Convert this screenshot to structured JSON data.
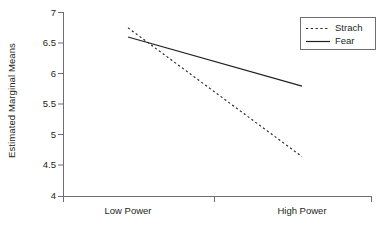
{
  "chart_data": {
    "type": "line",
    "title": "",
    "xlabel": "",
    "ylabel": "Estimated Marginal Means",
    "categories": [
      "Low Power",
      "High Power"
    ],
    "xtick_labels": [
      "Low Power",
      "High Power"
    ],
    "ytick_labels": [
      "4",
      "4.5",
      "5",
      "5.5",
      "6",
      "6.5",
      "7"
    ],
    "ytick_values": [
      4,
      4.5,
      5,
      5.5,
      6,
      6.5,
      7
    ],
    "ylim": [
      4,
      7
    ],
    "grid": false,
    "legend_position": "top-right",
    "series": [
      {
        "name": "Strach",
        "style": "dashed",
        "color": "#231f20",
        "values": [
          6.75,
          4.65
        ]
      },
      {
        "name": "Fear",
        "style": "solid",
        "color": "#231f20",
        "values": [
          6.6,
          5.8
        ]
      }
    ]
  },
  "legend": {
    "entries": [
      {
        "label": "Strach",
        "swatch": "dashed-line-swatch"
      },
      {
        "label": "Fear",
        "swatch": "solid-line-swatch"
      }
    ]
  },
  "axes": {
    "y_title": "Estimated Marginal Means",
    "y_ticks": [
      "7",
      "6.5",
      "6",
      "5.5",
      "5",
      "4.5",
      "4"
    ],
    "x_ticks": [
      "Low Power",
      "High Power"
    ]
  }
}
